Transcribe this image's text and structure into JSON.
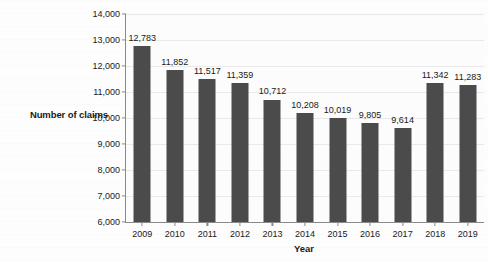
{
  "chart_data": {
    "type": "bar",
    "title": "",
    "xlabel": "Year",
    "ylabel": "Number of claims",
    "categories": [
      "2009",
      "2010",
      "2011",
      "2012",
      "2013",
      "2014",
      "2015",
      "2016",
      "2017",
      "2018",
      "2019"
    ],
    "values": [
      12783,
      11852,
      11517,
      11359,
      10712,
      10208,
      10019,
      9805,
      9614,
      11342,
      11283
    ],
    "data_labels": [
      "12,783",
      "11,852",
      "11,517",
      "11,359",
      "10,712",
      "10,208",
      "10,019",
      "9,805",
      "9,614",
      "11,342",
      "11,283"
    ],
    "ylim": [
      6000,
      14000
    ],
    "y_ticks": [
      6000,
      7000,
      8000,
      9000,
      10000,
      11000,
      12000,
      13000,
      14000
    ],
    "y_tick_labels": [
      "6,000",
      "7,000",
      "8,000",
      "9,000",
      "10,000",
      "11,000",
      "12,000",
      "13,000",
      "14,000"
    ],
    "grid": true,
    "legend": "none",
    "bar_color": "#4b4b4b",
    "axis_color": "#8a8a8a",
    "gridline_color": "#e9e9e9",
    "text_color": "#1a1a1a",
    "background_color": "#fcfcfc"
  }
}
